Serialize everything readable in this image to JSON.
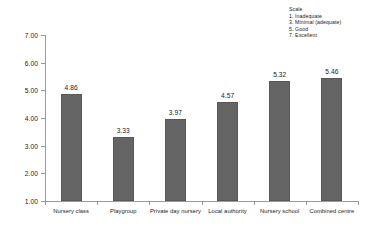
{
  "legend": {
    "title": "Scale",
    "items": [
      "1. Inadequate",
      "3. Minimal (adequate)",
      "5. Good",
      "7. Excellent"
    ]
  },
  "chart_data": {
    "type": "bar",
    "title": "",
    "xlabel": "",
    "ylabel": "",
    "categories": [
      "Nursery class",
      "Playgroup",
      "Private day nursery",
      "Local authority",
      "Nursery school",
      "Combined centre"
    ],
    "values": [
      4.86,
      3.33,
      3.97,
      4.57,
      5.32,
      5.46
    ],
    "value_labels": [
      "4.86",
      "3.33",
      "3.97",
      "4.57",
      "5.32",
      "5.46"
    ],
    "ylim": [
      1.0,
      7.0
    ],
    "ytick_step": 1.0,
    "ytick_labels": [
      "7.00",
      "6.00",
      "5.00",
      "4.00",
      "3.00",
      "2.00",
      "1.00"
    ],
    "ytick_values": [
      7.0,
      6.0,
      5.0,
      4.0,
      3.0,
      2.0,
      1.0
    ],
    "grid": false,
    "legend_position": "top-right",
    "bar_color": "#656565",
    "axis_color": "#9a9a9a",
    "background": "#ffffff"
  }
}
